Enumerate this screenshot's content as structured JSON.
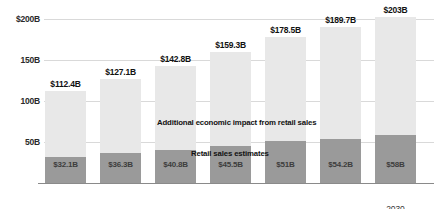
{
  "chart_data": {
    "type": "bar",
    "subtype": "stacked-bar",
    "title": "",
    "xlabel": "",
    "ylabel": "",
    "categories": [
      "2024",
      "2025",
      "2026",
      "2027",
      "2028",
      "2029",
      "2030"
    ],
    "emphasized_category": "2025",
    "ylim": [
      0,
      200
    ],
    "yticks": [
      0,
      50,
      100,
      150,
      200
    ],
    "ytick_labels": [
      "",
      "50B",
      "100B",
      "150B",
      "$200B"
    ],
    "grid": true,
    "legend_position": "inline-annotation",
    "units": "USD billions",
    "series": [
      {
        "name": "Retail sales estimates",
        "color": "#9a9a9a",
        "values": [
          32.1,
          36.3,
          40.8,
          45.5,
          51,
          54.2,
          58
        ],
        "labels": [
          "$32.1B",
          "$36.3B",
          "$40.8B",
          "$45.5B",
          "$51B",
          "$54.2B",
          "$58B"
        ]
      },
      {
        "name": "Additional economic impact from retail sales",
        "color": "#e8e8e8",
        "values": [
          80.3,
          90.8,
          102.0,
          113.8,
          127.5,
          135.5,
          145.0
        ]
      }
    ],
    "totals": [
      112.4,
      127.1,
      142.8,
      159.3,
      178.5,
      189.7,
      203
    ],
    "total_labels": [
      "$112.4B",
      "$127.1B",
      "$142.8B",
      "$159.3B",
      "$178.5B",
      "$189.7B",
      "$203B"
    ],
    "annotations": [
      "Additional economic impact from retail sales",
      "Retail sales estimates"
    ],
    "colors": {
      "segment_top": "#e8e8e8",
      "segment_bottom": "#9a9a9a",
      "gridline": "#d9d9d9",
      "axis": "#8a8a8a",
      "text": "#1a1a1a",
      "background": "#ffffff"
    }
  }
}
